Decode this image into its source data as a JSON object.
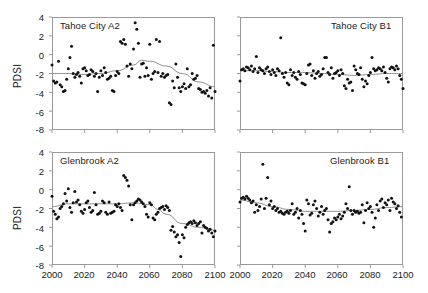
{
  "figure": {
    "ylabel": "PDSI",
    "xticks": [
      "2000",
      "2020",
      "2040",
      "2060",
      "2080",
      "2100"
    ],
    "yticks": [
      "4",
      "2",
      "0",
      "-2",
      "-4",
      "-6",
      "-8"
    ],
    "colors": {
      "marker": "#111111",
      "trend": "#8d8d8d",
      "axis": "#9a9a9a",
      "text": "#1a1a1a"
    }
  },
  "chart_data": [
    {
      "type": "scatter",
      "title": "Tahoe City A2",
      "panel": "top-left",
      "xlabel": "",
      "ylabel": "PDSI",
      "xlim": [
        2000,
        2100
      ],
      "ylim": [
        -8,
        4
      ],
      "xticks": [
        2000,
        2020,
        2040,
        2060,
        2080,
        2100
      ],
      "yticks": [
        -8,
        -6,
        -4,
        -2,
        0,
        2,
        4
      ],
      "grid": false,
      "legend": false,
      "title_align": "left",
      "series": [
        {
          "name": "PDSI annual",
          "marker": "filled-circle",
          "x": [
            2000,
            2001,
            2002,
            2003,
            2004,
            2005,
            2006,
            2007,
            2008,
            2009,
            2010,
            2011,
            2012,
            2013,
            2014,
            2015,
            2016,
            2017,
            2018,
            2019,
            2020,
            2021,
            2022,
            2023,
            2024,
            2025,
            2026,
            2027,
            2028,
            2029,
            2030,
            2031,
            2032,
            2033,
            2034,
            2035,
            2036,
            2037,
            2038,
            2039,
            2040,
            2041,
            2042,
            2043,
            2044,
            2045,
            2046,
            2047,
            2048,
            2049,
            2050,
            2051,
            2052,
            2053,
            2054,
            2055,
            2056,
            2057,
            2058,
            2059,
            2060,
            2061,
            2062,
            2063,
            2064,
            2065,
            2066,
            2067,
            2068,
            2069,
            2070,
            2071,
            2072,
            2073,
            2074,
            2075,
            2076,
            2077,
            2078,
            2079,
            2080,
            2081,
            2082,
            2083,
            2084,
            2085,
            2086,
            2087,
            2088,
            2089,
            2090,
            2091,
            2092,
            2093,
            2094,
            2095,
            2096,
            2097,
            2098,
            2099,
            2100
          ],
          "y": [
            -1.1,
            -2.8,
            -3.0,
            -2.9,
            -0.7,
            -3.2,
            -3.4,
            -3.9,
            -3.8,
            -2.6,
            -1.5,
            -0.3,
            0.9,
            -2.0,
            -2.4,
            -2.1,
            -1.9,
            -2.3,
            -3.0,
            -1.5,
            -1.4,
            -1.7,
            -2.2,
            -2.1,
            -1.6,
            -1.8,
            -2.3,
            -2.0,
            -3.9,
            -2.4,
            -1.7,
            -2.2,
            -1.4,
            -1.9,
            -2.6,
            -2.5,
            -2.3,
            -3.8,
            -3.9,
            -2.2,
            -1.8,
            -2.0,
            1.4,
            1.2,
            1.6,
            1.1,
            -1.2,
            -2.3,
            -1.0,
            -1.5,
            0.6,
            3.4,
            2.7,
            1.2,
            -2.4,
            -1.0,
            -0.9,
            -2.3,
            -1.4,
            -2.2,
            1.1,
            -2.6,
            -2.0,
            -1.8,
            1.6,
            -1.9,
            1.4,
            -2.3,
            -2.0,
            -2.4,
            -2.2,
            -2.1,
            -5.1,
            -5.3,
            -2.8,
            -3.5,
            -1.0,
            -2.4,
            -3.5,
            -3.9,
            -3.4,
            -3.1,
            -3.6,
            -1.5,
            -3.4,
            -3.2,
            -2.0,
            -2.6,
            -2.5,
            -2.2,
            -3.6,
            -3.7,
            -4.0,
            -3.9,
            -4.1,
            -3.8,
            -4.4,
            -3.5,
            -4.6,
            1.0,
            -3.9
          ]
        }
      ],
      "trend": {
        "name": "smoothed trend",
        "x": [
          2000,
          2010,
          2020,
          2030,
          2040,
          2050,
          2055,
          2060,
          2070,
          2080,
          2090,
          2100
        ],
        "y": [
          -2.0,
          -2.0,
          -2.1,
          -2.0,
          -1.7,
          -1.1,
          -0.6,
          -0.7,
          -1.2,
          -2.0,
          -2.9,
          -3.4
        ]
      }
    },
    {
      "type": "scatter",
      "title": "Tahoe City B1",
      "panel": "top-right",
      "xlabel": "",
      "ylabel": "",
      "xlim": [
        2000,
        2100
      ],
      "ylim": [
        -8,
        4
      ],
      "xticks": [
        2000,
        2020,
        2040,
        2060,
        2080,
        2100
      ],
      "yticks": [
        -8,
        -6,
        -4,
        -2,
        0,
        2,
        4
      ],
      "grid": false,
      "legend": false,
      "title_align": "right",
      "series": [
        {
          "name": "PDSI annual",
          "marker": "filled-circle",
          "x": [
            2000,
            2001,
            2002,
            2003,
            2004,
            2005,
            2006,
            2007,
            2008,
            2009,
            2010,
            2011,
            2012,
            2013,
            2014,
            2015,
            2016,
            2017,
            2018,
            2019,
            2020,
            2021,
            2022,
            2023,
            2024,
            2025,
            2026,
            2027,
            2028,
            2029,
            2030,
            2031,
            2032,
            2033,
            2034,
            2035,
            2036,
            2037,
            2038,
            2039,
            2040,
            2041,
            2042,
            2043,
            2044,
            2045,
            2046,
            2047,
            2048,
            2049,
            2050,
            2051,
            2052,
            2053,
            2054,
            2055,
            2056,
            2057,
            2058,
            2059,
            2060,
            2061,
            2062,
            2063,
            2064,
            2065,
            2066,
            2067,
            2068,
            2069,
            2070,
            2071,
            2072,
            2073,
            2074,
            2075,
            2076,
            2077,
            2078,
            2079,
            2080,
            2081,
            2082,
            2083,
            2084,
            2085,
            2086,
            2087,
            2088,
            2089,
            2090,
            2091,
            2092,
            2093,
            2094,
            2095,
            2096,
            2097,
            2098,
            2099,
            2100
          ],
          "y": [
            -2.8,
            -1.6,
            -1.5,
            -1.7,
            -1.3,
            -1.4,
            -1.6,
            -1.2,
            -1.8,
            -1.5,
            -0.2,
            -1.9,
            -1.4,
            -1.6,
            -1.7,
            -2.0,
            -1.5,
            -1.3,
            -1.8,
            -2.1,
            -1.6,
            -1.9,
            -2.2,
            -1.5,
            -1.7,
            1.8,
            -2.0,
            -2.4,
            -1.9,
            -3.0,
            -3.2,
            -1.6,
            -2.2,
            -1.9,
            -2.4,
            -2.6,
            -1.8,
            -2.1,
            -3.0,
            -3.1,
            -3.2,
            -2.0,
            -1.1,
            -1.0,
            -2.2,
            -1.7,
            -2.5,
            -2.0,
            -1.8,
            -2.3,
            -2.1,
            -1.5,
            -0.3,
            -0.3,
            -1.9,
            -2.1,
            -1.4,
            -2.5,
            -2.0,
            -1.9,
            -1.7,
            -2.2,
            -1.6,
            -2.0,
            -3.3,
            -3.6,
            -2.6,
            -3.0,
            -2.9,
            -3.8,
            -1.2,
            -1.6,
            -2.0,
            -2.1,
            -1.4,
            -2.6,
            -3.4,
            -2.8,
            -3.1,
            -2.2,
            -1.9,
            -0.3,
            -1.5,
            -1.7,
            -1.6,
            -1.4,
            -1.5,
            -1.7,
            -1.3,
            -1.9,
            -2.5,
            -2.9,
            -1.5,
            -1.3,
            -1.4,
            -1.6,
            -1.2,
            -1.5,
            -2.2,
            -2.6,
            -3.6
          ]
        }
      ],
      "trend": {
        "name": "smoothed trend",
        "x": [
          2000,
          2010,
          2020,
          2030,
          2040,
          2050,
          2060,
          2070,
          2080,
          2090,
          2100
        ],
        "y": [
          -1.7,
          -1.7,
          -1.8,
          -1.9,
          -1.9,
          -2.0,
          -2.1,
          -2.2,
          -2.1,
          -2.0,
          -2.0
        ]
      }
    },
    {
      "type": "scatter",
      "title": "Glenbrook A2",
      "panel": "bottom-left",
      "xlabel": "",
      "ylabel": "PDSI",
      "xlim": [
        2000,
        2100
      ],
      "ylim": [
        -8,
        4
      ],
      "xticks": [
        2000,
        2020,
        2040,
        2060,
        2080,
        2100
      ],
      "yticks": [
        -8,
        -6,
        -4,
        -2,
        0,
        2,
        4
      ],
      "grid": false,
      "legend": false,
      "title_align": "left",
      "series": [
        {
          "name": "PDSI annual",
          "marker": "filled-circle",
          "x": [
            2000,
            2001,
            2002,
            2003,
            2004,
            2005,
            2006,
            2007,
            2008,
            2009,
            2010,
            2011,
            2012,
            2013,
            2014,
            2015,
            2016,
            2017,
            2018,
            2019,
            2020,
            2021,
            2022,
            2023,
            2024,
            2025,
            2026,
            2027,
            2028,
            2029,
            2030,
            2031,
            2032,
            2033,
            2034,
            2035,
            2036,
            2037,
            2038,
            2039,
            2040,
            2041,
            2042,
            2043,
            2044,
            2045,
            2046,
            2047,
            2048,
            2049,
            2050,
            2051,
            2052,
            2053,
            2054,
            2055,
            2056,
            2057,
            2058,
            2059,
            2060,
            2061,
            2062,
            2063,
            2064,
            2065,
            2066,
            2067,
            2068,
            2069,
            2070,
            2071,
            2072,
            2073,
            2074,
            2075,
            2076,
            2077,
            2078,
            2079,
            2080,
            2081,
            2082,
            2083,
            2084,
            2085,
            2086,
            2087,
            2088,
            2089,
            2090,
            2091,
            2092,
            2093,
            2094,
            2095,
            2096,
            2097,
            2098,
            2099,
            2100
          ],
          "y": [
            -0.7,
            -2.3,
            -2.6,
            -3.1,
            -2.9,
            -2.0,
            -1.8,
            -1.5,
            -0.4,
            -1.2,
            0.1,
            -1.9,
            -2.4,
            -1.4,
            -0.2,
            -1.3,
            -1.1,
            -1.6,
            -2.3,
            -2.5,
            -2.1,
            -1.4,
            -1.2,
            -1.9,
            -2.4,
            -2.2,
            -0.3,
            -1.6,
            -2.6,
            -2.5,
            -2.3,
            -1.2,
            -1.4,
            -2.4,
            -2.6,
            -1.3,
            -2.5,
            -2.4,
            -2.3,
            -1.6,
            -1.8,
            -1.5,
            -1.9,
            -2.2,
            1.5,
            1.3,
            1.0,
            0.4,
            -1.6,
            -3.2,
            -1.6,
            -1.4,
            -1.2,
            -1.0,
            -1.1,
            -1.3,
            -1.5,
            -1.8,
            -2.6,
            -2.9,
            -1.4,
            -1.6,
            -3.0,
            -3.2,
            -2.6,
            -2.4,
            -2.0,
            -1.9,
            -1.8,
            -2.1,
            -1.7,
            -1.9,
            -2.2,
            -4.3,
            -3.9,
            -4.5,
            -5.0,
            -4.8,
            -5.6,
            -7.1,
            -4.8,
            -5.1,
            -4.0,
            -3.7,
            -3.5,
            -3.4,
            -3.6,
            -3.3,
            -3.5,
            -3.8,
            -3.6,
            -3.4,
            -4.6,
            -3.8,
            -4.0,
            -4.1,
            -4.4,
            -4.2,
            -4.6,
            -5.0,
            -4.4
          ]
        }
      ],
      "trend": {
        "name": "smoothed trend",
        "x": [
          2000,
          2010,
          2020,
          2030,
          2040,
          2050,
          2060,
          2065,
          2070,
          2080,
          2090,
          2100
        ],
        "y": [
          -1.8,
          -1.5,
          -1.5,
          -1.5,
          -1.5,
          -1.4,
          -1.6,
          -2.1,
          -2.6,
          -3.6,
          -4.0,
          -4.3
        ]
      }
    },
    {
      "type": "scatter",
      "title": "Glenbrook B1",
      "panel": "bottom-right",
      "xlabel": "",
      "ylabel": "",
      "xlim": [
        2000,
        2100
      ],
      "ylim": [
        -8,
        4
      ],
      "xticks": [
        2000,
        2020,
        2040,
        2060,
        2080,
        2100
      ],
      "yticks": [
        -8,
        -6,
        -4,
        -2,
        0,
        2,
        4
      ],
      "grid": false,
      "legend": false,
      "title_align": "right",
      "series": [
        {
          "name": "PDSI annual",
          "marker": "filled-circle",
          "x": [
            2000,
            2001,
            2002,
            2003,
            2004,
            2005,
            2006,
            2007,
            2008,
            2009,
            2010,
            2011,
            2012,
            2013,
            2014,
            2015,
            2016,
            2017,
            2018,
            2019,
            2020,
            2021,
            2022,
            2023,
            2024,
            2025,
            2026,
            2027,
            2028,
            2029,
            2030,
            2031,
            2032,
            2033,
            2034,
            2035,
            2036,
            2037,
            2038,
            2039,
            2040,
            2041,
            2042,
            2043,
            2044,
            2045,
            2046,
            2047,
            2048,
            2049,
            2050,
            2051,
            2052,
            2053,
            2054,
            2055,
            2056,
            2057,
            2058,
            2059,
            2060,
            2061,
            2062,
            2063,
            2064,
            2065,
            2066,
            2067,
            2068,
            2069,
            2070,
            2071,
            2072,
            2073,
            2074,
            2075,
            2076,
            2077,
            2078,
            2079,
            2080,
            2081,
            2082,
            2083,
            2084,
            2085,
            2086,
            2087,
            2088,
            2089,
            2090,
            2091,
            2092,
            2093,
            2094,
            2095,
            2096,
            2097,
            2098,
            2099,
            2100
          ],
          "y": [
            -1.3,
            -0.9,
            -0.8,
            -1.0,
            -0.7,
            -0.9,
            -1.1,
            -1.4,
            -1.2,
            -2.4,
            -1.6,
            -2.2,
            -1.8,
            -1.0,
            2.7,
            -2.0,
            -0.9,
            1.3,
            -1.6,
            -1.2,
            -2.0,
            -1.8,
            -2.2,
            -2.0,
            -2.4,
            -2.3,
            -2.5,
            -2.6,
            -2.4,
            -2.3,
            -2.5,
            -2.2,
            -1.5,
            -2.6,
            -2.4,
            -2.0,
            -3.0,
            -2.2,
            -2.6,
            -3.6,
            -4.4,
            -1.1,
            -1.5,
            -2.7,
            -2.5,
            -1.6,
            -1.2,
            -2.0,
            -2.8,
            -2.4,
            -1.8,
            -2.6,
            -2.2,
            -2.0,
            -3.2,
            -4.5,
            -3.6,
            -3.4,
            -3.0,
            -3.2,
            -2.9,
            -2.6,
            -3.1,
            -2.8,
            -2.4,
            -1.5,
            -2.0,
            0.3,
            -2.2,
            -2.6,
            -2.2,
            -2.4,
            -2.3,
            -2.5,
            -2.4,
            -1.6,
            -3.5,
            -2.2,
            -1.4,
            -2.0,
            -1.8,
            -2.4,
            -4.0,
            -3.0,
            -1.6,
            -2.2,
            -1.2,
            -1.0,
            -1.9,
            -1.4,
            -1.6,
            -1.1,
            -2.2,
            -0.9,
            -1.3,
            -1.5,
            -2.0,
            -1.7,
            -2.4,
            -2.9
          ]
        }
      ],
      "trend": {
        "name": "smoothed trend",
        "x": [
          2000,
          2010,
          2020,
          2030,
          2040,
          2050,
          2060,
          2070,
          2080,
          2090,
          2100
        ],
        "y": [
          -1.1,
          -1.4,
          -1.8,
          -2.1,
          -2.3,
          -2.3,
          -2.3,
          -2.2,
          -2.1,
          -1.9,
          -1.8
        ]
      }
    }
  ]
}
